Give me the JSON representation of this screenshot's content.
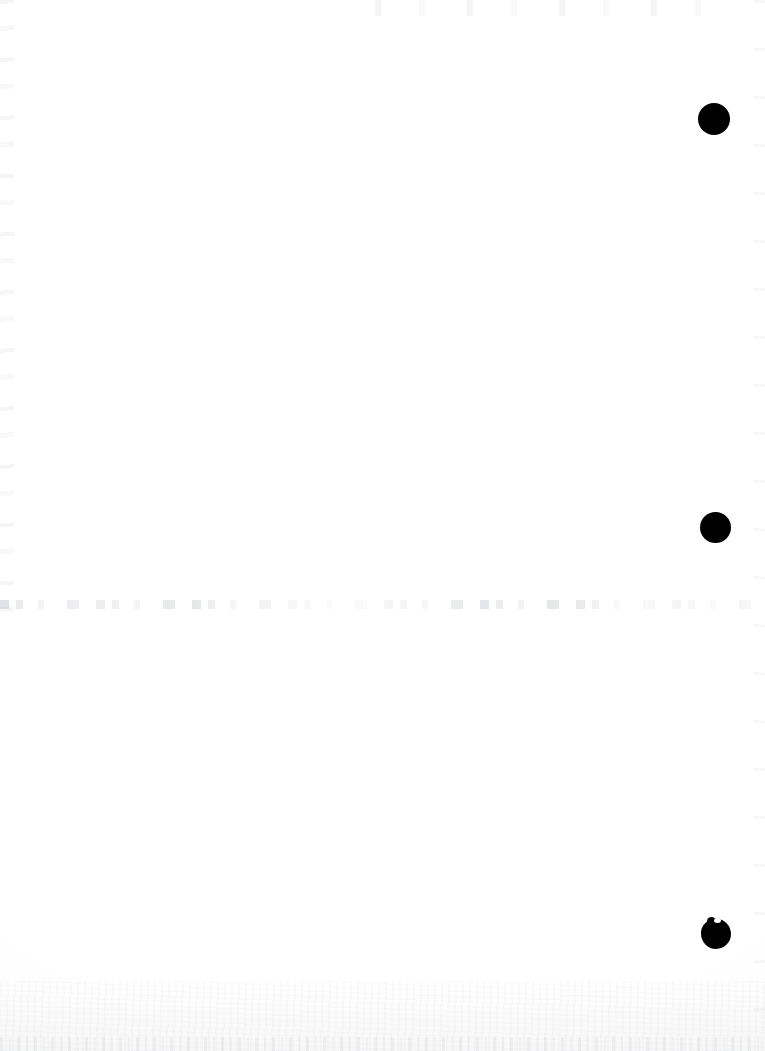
{
  "document": {
    "type": "scanned-page",
    "title": "Scanned blank page",
    "page_width": 765,
    "page_height": 1051,
    "background_color": "#ffffff",
    "ink_color": "#000000",
    "content_text": "",
    "description": "Blank scanned document page with three black circular ink marks in the right margin and a faint horizontal dust line across the middle"
  },
  "marks": [
    {
      "name": "ink-mark-top",
      "label": "Mark 1",
      "shape": "circle",
      "color": "#000000",
      "center_x": 714,
      "center_y": 119,
      "diameter": 32,
      "irregular": false
    },
    {
      "name": "ink-mark-middle",
      "label": "Mark 2",
      "shape": "circle",
      "color": "#000000",
      "center_x": 715,
      "center_y": 527,
      "diameter": 31,
      "irregular": false
    },
    {
      "name": "ink-mark-bottom",
      "label": "Mark 3",
      "shape": "irregular-circle",
      "color": "#000000",
      "center_x": 716,
      "center_y": 934,
      "diameter": 30,
      "irregular": true
    }
  ],
  "artifacts": {
    "dust_line": {
      "label": "Faint horizontal dust line",
      "color": "#969aa1",
      "y": 600,
      "x_start": 0,
      "x_end": 765,
      "thickness": 9
    },
    "edge_noise": {
      "label": "Scanner edge noise",
      "color": "#9ba1a8"
    },
    "bottom_grain": {
      "label": "Paper grain at lower edge",
      "color": "#a8aab0"
    }
  }
}
